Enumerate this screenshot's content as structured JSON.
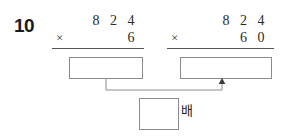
{
  "worksheet": {
    "problem_number": "10",
    "unit_label": "배",
    "ink_color": "#2a2a2a",
    "box_border_color": "#8c8c8c",
    "rule_color": "#555555"
  },
  "problems": [
    {
      "id": "left",
      "multiplicand": "8 2 4",
      "operator": "×",
      "multiplier": "6",
      "answer": "",
      "answer_placeholder": ""
    },
    {
      "id": "right",
      "multiplicand": "8 2 4",
      "operator": "×",
      "multiplier": "6 0",
      "answer": "",
      "answer_placeholder": ""
    }
  ],
  "comparison": {
    "answer": "",
    "answer_placeholder": "",
    "unit": "배",
    "arrow": "up-arrow"
  }
}
